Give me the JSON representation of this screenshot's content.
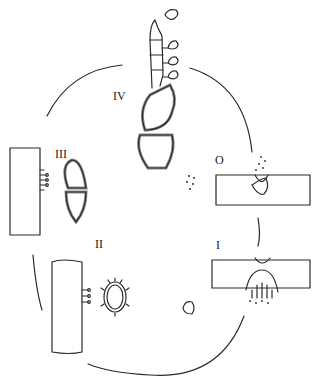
{
  "diagram": {
    "type": "life-cycle",
    "layout": "circular",
    "stroke_color": "#2a2a2a",
    "stages": [
      {
        "id": "O",
        "label": "O",
        "description": "spermogonium erupting through host tissue with spermatia"
      },
      {
        "id": "I",
        "label": "I",
        "description": "aecium opening below host tissue releasing aeciospores"
      },
      {
        "id": "II",
        "label": "II",
        "description": "uredinium on host stem with spiny urediniospore"
      },
      {
        "id": "III",
        "label": "III",
        "description": "telium on host stem with two-celled teliospore"
      },
      {
        "id": "IV",
        "label": "IV",
        "description": "germinating teliospore with basidium bearing basidiospores"
      }
    ]
  }
}
